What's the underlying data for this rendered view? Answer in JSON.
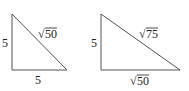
{
  "triangles": [
    {
      "name": "left-triangle",
      "vertical_leg": "5",
      "horizontal_leg": "5",
      "hypotenuse_radicand": "50"
    },
    {
      "name": "right-triangle",
      "vertical_leg": "5",
      "horizontal_leg_radicand": "50",
      "hypotenuse_radicand": "75"
    }
  ],
  "colors": {
    "line": "#555555",
    "text": "#222222"
  }
}
